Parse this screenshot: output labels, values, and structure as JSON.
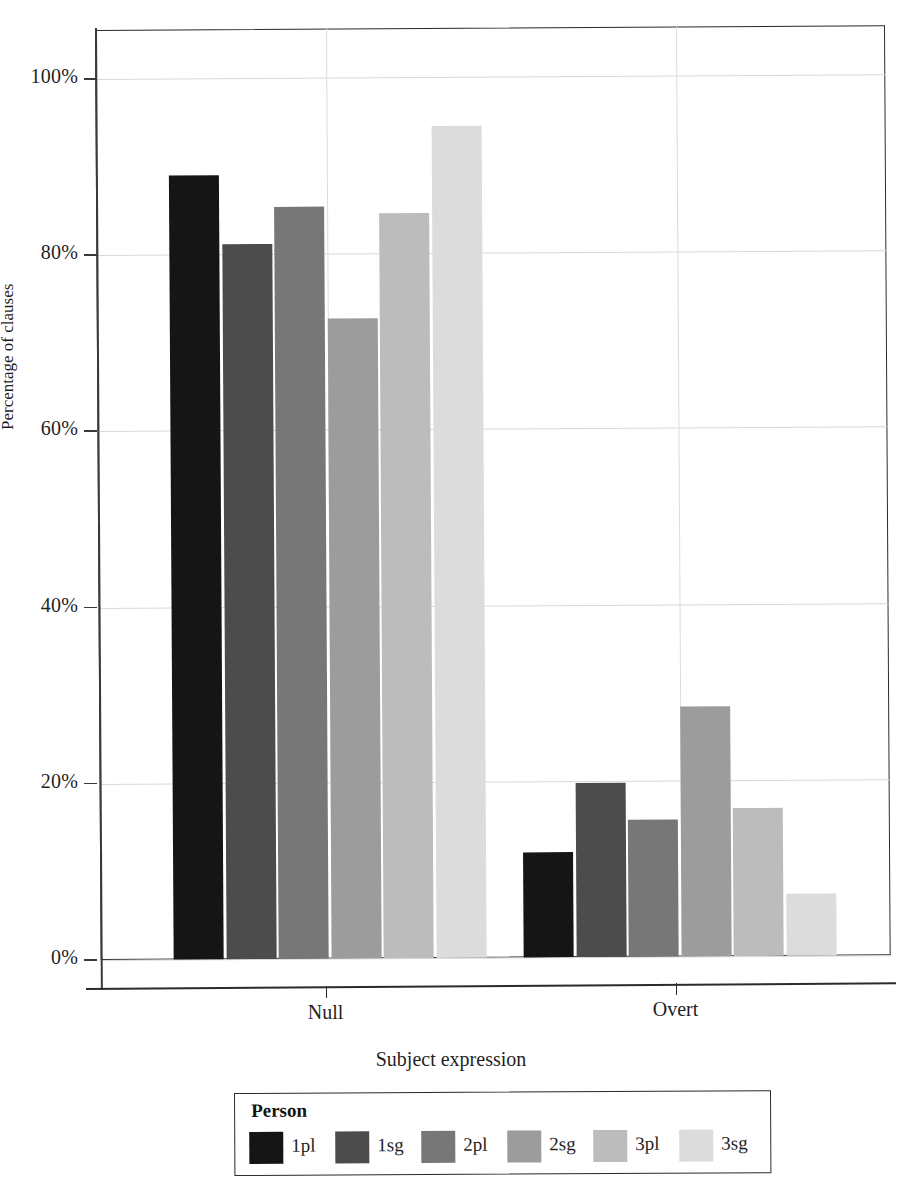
{
  "chart_data": {
    "type": "bar",
    "title": "",
    "xlabel": "Subject expression",
    "ylabel": "Percentage of clauses",
    "categories": [
      "Null",
      "Overt"
    ],
    "ylim": [
      0,
      100
    ],
    "ytick_labels": [
      "0%",
      "20%",
      "40%",
      "60%",
      "80%",
      "100%"
    ],
    "ytick_values": [
      0,
      20,
      40,
      60,
      80,
      100
    ],
    "grid": true,
    "legend_position": "bottom",
    "legend_title": "Person",
    "series": [
      {
        "name": "1pl",
        "color": "#151515",
        "values": [
          89.0,
          11.9
        ]
      },
      {
        "name": "1sg",
        "color": "#4c4c4c",
        "values": [
          81.2,
          19.7
        ]
      },
      {
        "name": "2pl",
        "color": "#777777",
        "values": [
          85.4,
          15.5
        ]
      },
      {
        "name": "2sg",
        "color": "#9c9c9c",
        "values": [
          72.7,
          28.4
        ]
      },
      {
        "name": "3pl",
        "color": "#bcbcbc",
        "values": [
          84.6,
          16.8
        ]
      },
      {
        "name": "3sg",
        "color": "#dcdcdc",
        "values": [
          94.4,
          7.0
        ]
      }
    ]
  },
  "axes": {
    "y_title": "Percentage of clauses",
    "x_title": "Subject expression",
    "y_ticks": [
      {
        "label": "100%",
        "value": 100
      },
      {
        "label": "80%",
        "value": 80
      },
      {
        "label": "60%",
        "value": 60
      },
      {
        "label": "40%",
        "value": 40
      },
      {
        "label": "20%",
        "value": 20
      },
      {
        "label": "0%",
        "value": 0
      }
    ],
    "x_ticks": [
      {
        "label": "Null"
      },
      {
        "label": "Overt"
      }
    ]
  },
  "legend": {
    "title": "Person",
    "entries": [
      {
        "label": "1pl",
        "color": "#151515"
      },
      {
        "label": "1sg",
        "color": "#4c4c4c"
      },
      {
        "label": "2pl",
        "color": "#777777"
      },
      {
        "label": "2sg",
        "color": "#9c9c9c"
      },
      {
        "label": "3pl",
        "color": "#bcbcbc"
      },
      {
        "label": "3sg",
        "color": "#dcdcdc"
      }
    ]
  }
}
